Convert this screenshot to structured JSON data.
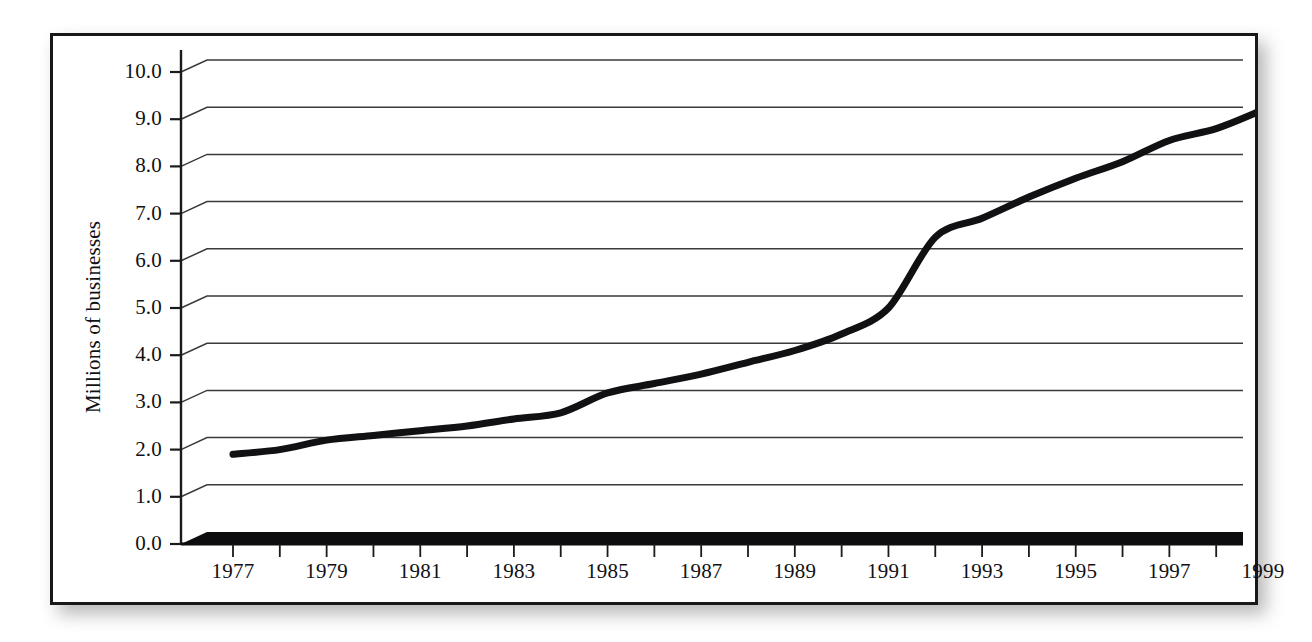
{
  "figure": {
    "background_color": "#ffffff",
    "frame_color": "#18181a",
    "line_color": "#111114",
    "grid_color": "#3a3a3a",
    "shadow_color": "#9b9b9b"
  },
  "axis": {
    "ylabel": "Millions of businesses",
    "ytick_labels": [
      "10.0",
      "9.0",
      "8.0",
      "7.0",
      "6.0",
      "5.0",
      "4.0",
      "3.0",
      "2.0",
      "1.0",
      "0.0"
    ],
    "xtick_labels": [
      "1977",
      "1979",
      "1981",
      "1983",
      "1985",
      "1987",
      "1989",
      "1991",
      "1993",
      "1995",
      "1997",
      "1999"
    ]
  },
  "chart_data": {
    "type": "line",
    "title": "",
    "subtitle": "",
    "xlabel": "",
    "ylabel": "Millions of businesses",
    "xlim": [
      1977,
      1999
    ],
    "ylim": [
      0.0,
      10.0
    ],
    "ytick_values": [
      0.0,
      1.0,
      2.0,
      3.0,
      4.0,
      5.0,
      6.0,
      7.0,
      8.0,
      9.0,
      10.0
    ],
    "xtick_values": [
      1977,
      1978,
      1979,
      1980,
      1981,
      1982,
      1983,
      1984,
      1985,
      1986,
      1987,
      1988,
      1989,
      1990,
      1991,
      1992,
      1993,
      1994,
      1995,
      1996,
      1997,
      1998,
      1999
    ],
    "xtick_labeled": [
      1977,
      1979,
      1981,
      1983,
      1985,
      1987,
      1989,
      1991,
      1993,
      1995,
      1997,
      1999
    ],
    "grid": true,
    "grid_axis": "y",
    "legend": false,
    "legend_position": "none",
    "annotations": [],
    "x": [
      1977,
      1978,
      1979,
      1980,
      1981,
      1982,
      1983,
      1984,
      1985,
      1986,
      1987,
      1988,
      1989,
      1990,
      1991,
      1992,
      1993,
      1994,
      1995,
      1996,
      1997,
      1998,
      1999
    ],
    "values": [
      1.9,
      2.0,
      2.2,
      2.3,
      2.4,
      2.5,
      2.65,
      2.78,
      3.2,
      3.4,
      3.6,
      3.85,
      4.1,
      4.45,
      5.0,
      6.5,
      6.9,
      7.35,
      7.75,
      8.1,
      8.55,
      8.8,
      9.2
    ],
    "series": [
      {
        "name": "Millions of businesses",
        "color": "#111114",
        "line_width": 7,
        "values": [
          1.9,
          2.0,
          2.2,
          2.3,
          2.4,
          2.5,
          2.65,
          2.78,
          3.2,
          3.4,
          3.6,
          3.85,
          4.1,
          4.45,
          5.0,
          6.5,
          6.9,
          7.35,
          7.75,
          8.1,
          8.55,
          8.8,
          9.2
        ]
      }
    ]
  }
}
